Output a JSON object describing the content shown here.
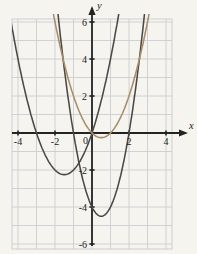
{
  "figure": {
    "xlabel": "x",
    "ylabel": "y",
    "origin_label": "0",
    "x_tick_labels": [
      {
        "v": -4,
        "label": "-4"
      },
      {
        "v": -2,
        "label": "-2"
      },
      {
        "v": 2,
        "label": "2"
      },
      {
        "v": 4,
        "label": "4"
      }
    ],
    "y_tick_labels": [
      {
        "v": 6,
        "label": "6"
      },
      {
        "v": 4,
        "label": "4"
      },
      {
        "v": 2,
        "label": "2"
      },
      {
        "v": -2,
        "label": "-2"
      },
      {
        "v": -4,
        "label": "-4"
      },
      {
        "v": -6,
        "label": "-6"
      }
    ]
  },
  "chart_data": {
    "type": "line",
    "xlabel": "x",
    "ylabel": "y",
    "xlim": [
      -4,
      4
    ],
    "ylim": [
      -6,
      6
    ],
    "grid": true,
    "grid_step": 1,
    "tick_label_step": 2,
    "legend": "none",
    "series": [
      {
        "name": "parabola-1",
        "equation": "y = x^2 + 3x",
        "coeffs": {
          "a": 1,
          "b": 3,
          "c": 0
        },
        "vertex": [
          -1.5,
          -2.25
        ],
        "x_intercepts": [
          -3,
          0
        ],
        "y_intercept": 0,
        "color": "#4b4946"
      },
      {
        "name": "parabola-2",
        "equation": "y = 2x^2 - 2x - 4",
        "coeffs": {
          "a": 2,
          "b": -2,
          "c": -4
        },
        "vertex": [
          0.5,
          -4.5
        ],
        "x_intercepts": [
          -1,
          2
        ],
        "y_intercept": -4,
        "color": "#4b4946"
      },
      {
        "name": "parabola-3",
        "equation": "y = x^2 - x",
        "coeffs": {
          "a": 1,
          "b": -1,
          "c": 0
        },
        "vertex": [
          0.5,
          -0.25
        ],
        "x_intercepts": [
          0,
          1
        ],
        "y_intercept": 0,
        "color": "#a88d6b"
      }
    ]
  },
  "colors": {
    "paper": "#f6f4ef",
    "grid": "#c9cdd1",
    "axis": "#232323",
    "label_text": "#1c1c1c"
  }
}
